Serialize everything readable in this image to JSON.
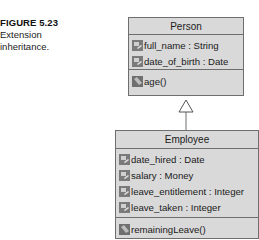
{
  "caption": {
    "figure_label": "FIGURE 5.23",
    "description_line1": "Extension",
    "description_line2": "inheritance."
  },
  "diagram": {
    "type": "UML class diagram",
    "relationship": "generalization (Employee extends Person)",
    "colors": {
      "class_fill": "#d9d9d9",
      "border": "#6e6e6e",
      "icon": "#7a7a7a"
    },
    "classes": [
      {
        "name": "Person",
        "attributes": [
          "full_name : String",
          "date_of_birth : Date"
        ],
        "operations": [
          "age()"
        ]
      },
      {
        "name": "Employee",
        "attributes": [
          "date_hired : Date",
          "salary : Money",
          "leave_entitlement : Integer",
          "leave_taken : Integer"
        ],
        "operations": [
          "remainingLeave()"
        ]
      }
    ]
  }
}
